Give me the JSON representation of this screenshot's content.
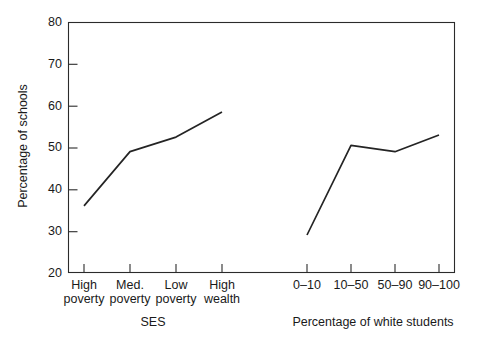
{
  "chart_data": {
    "type": "line",
    "title": "",
    "subtitle": "",
    "ylabel": "Percentage of schools",
    "ylim": [
      20,
      80
    ],
    "yticks": [
      20,
      30,
      40,
      50,
      60,
      70,
      80
    ],
    "ytick_labels": [
      "20",
      "30",
      "40",
      "50",
      "60",
      "70",
      "80"
    ],
    "grid": false,
    "legend": false,
    "legend_position": "none",
    "panels": [
      {
        "name": "ses-panel",
        "xlabel": "SES",
        "categories": [
          "High poverty",
          "Med. poverty",
          "Low poverty",
          "High wealth"
        ],
        "category_lines": [
          [
            "High",
            "poverty"
          ],
          [
            "Med.",
            "poverty"
          ],
          [
            "Low",
            "poverty"
          ],
          [
            "High",
            "wealth"
          ]
        ],
        "series": [
          {
            "name": "Percentage of schools by SES",
            "values": [
              36,
              49,
              52.5,
              58.5
            ]
          }
        ]
      },
      {
        "name": "white-students-panel",
        "xlabel": "Percentage of white students",
        "categories": [
          "0–10",
          "10–50",
          "50–90",
          "90–100"
        ],
        "category_lines": [
          [
            "0–10",
            ""
          ],
          [
            "10–50",
            ""
          ],
          [
            "50–90",
            ""
          ],
          [
            "90–100",
            ""
          ]
        ],
        "series": [
          {
            "name": "Percentage of schools by percentage of white students",
            "values": [
              29,
              50.5,
              49,
              53
            ]
          }
        ]
      }
    ],
    "colors": {
      "line": "#242424",
      "axis": "#2b2b2b",
      "background": "#ffffff",
      "text": "#1a1a1a"
    }
  }
}
